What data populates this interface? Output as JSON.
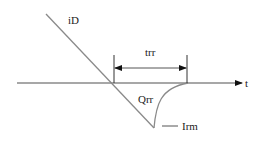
{
  "diagram": {
    "labels": {
      "current": "iD",
      "time_axis": "t",
      "recovery_time": "trr",
      "recovery_charge": "Qrr",
      "peak_reverse_current": "Irm"
    },
    "colors": {
      "line": "#8a8a8a",
      "axis": "#8a8a8a",
      "arrow": "#111111",
      "text": "#222222",
      "background": "#ffffff"
    }
  }
}
